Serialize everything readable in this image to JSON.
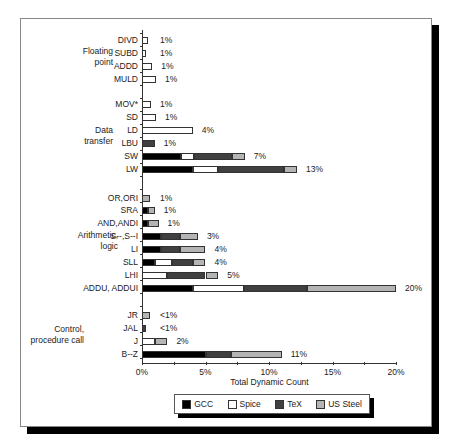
{
  "chart_data": {
    "type": "bar",
    "orientation": "horizontal-stacked",
    "title": "",
    "xlabel": "Total Dynamic Count",
    "ylabel": "",
    "xlim": [
      0,
      20
    ],
    "x_ticks": [
      "0%",
      "5%",
      "10%",
      "15%",
      "20%"
    ],
    "grid": false,
    "legend_position": "bottom",
    "series_names": [
      "GCC",
      "Spice",
      "TeX",
      "US Steel"
    ],
    "series_colors": [
      "#000000",
      "#ffffff",
      "#404040",
      "#b4b4b4"
    ],
    "groups": [
      {
        "name": "Floating point",
        "rows": [
          "DIVD",
          "SUBD",
          "ADDD",
          "MULD"
        ]
      },
      {
        "name": "Data transfer",
        "rows": [
          "MOV*",
          "SD",
          "LD",
          "LBU",
          "SW",
          "LW"
        ]
      },
      {
        "name": "Arithmetic, logic",
        "rows": [
          "OR,ORI",
          "SRA",
          "AND,ANDI",
          "S--,S--I",
          "LI",
          "SLL",
          "LHI",
          "ADDU, ADDUI"
        ]
      },
      {
        "name": "Control, procedure call",
        "rows": [
          "JR",
          "JAL",
          "J",
          "B--Z"
        ]
      }
    ],
    "categories": [
      "DIVD",
      "SUBD",
      "ADDD",
      "MULD",
      "MOV*",
      "SD",
      "LD",
      "LBU",
      "SW",
      "LW",
      "OR,ORI",
      "SRA",
      "AND,ANDI",
      "S--,S--I",
      "LI",
      "SLL",
      "LHI",
      "ADDU, ADDUI",
      "JR",
      "JAL",
      "J",
      "B--Z"
    ],
    "series": [
      {
        "name": "GCC",
        "values": [
          0,
          0,
          0,
          0,
          0,
          0,
          0,
          0,
          3.1,
          4.0,
          0,
          0.5,
          0.5,
          1.5,
          1.5,
          1.0,
          0,
          4.0,
          0,
          0,
          0,
          5.0
        ]
      },
      {
        "name": "Spice",
        "values": [
          0.5,
          0.3,
          0.8,
          1.1,
          0.7,
          1.1,
          4.0,
          0,
          1.0,
          2.0,
          0,
          0,
          0,
          0,
          0,
          1.4,
          2.0,
          4.0,
          0,
          0,
          1.0,
          0
        ]
      },
      {
        "name": "TeX",
        "values": [
          0,
          0,
          0,
          0,
          0,
          0,
          0,
          1.0,
          3.0,
          5.2,
          0,
          0,
          0,
          1.5,
          1.5,
          1.6,
          3.0,
          5.0,
          0,
          0.3,
          0,
          2.0
        ]
      },
      {
        "name": "US Steel",
        "values": [
          0,
          0,
          0,
          0,
          0,
          0,
          0,
          0,
          1.0,
          1.0,
          0.6,
          0.5,
          0.8,
          1.4,
          2.0,
          1.0,
          1.0,
          7.0,
          0.6,
          0,
          1.0,
          4.0
        ]
      }
    ],
    "value_labels": [
      "1%",
      "1%",
      "1%",
      "1%",
      "1%",
      "1%",
      "4%",
      "1%",
      "7%",
      "13%",
      "1%",
      "1%",
      "1%",
      "3%",
      "4%",
      "4%",
      "5%",
      "20%",
      "<1%",
      "<1%",
      "2%",
      "11%"
    ]
  },
  "legend": {
    "items": [
      {
        "label": "GCC",
        "color": "#000000"
      },
      {
        "label": "Spice",
        "color": "#ffffff"
      },
      {
        "label": "TeX",
        "color": "#404040"
      },
      {
        "label": "US Steel",
        "color": "#b4b4b4"
      }
    ]
  },
  "group_labels": [
    {
      "line1": "Floating",
      "line2": "point"
    },
    {
      "line1": "Data",
      "line2": "transfer"
    },
    {
      "line1": "Arithmetic,",
      "line2": "logic"
    },
    {
      "line1": "Control,",
      "line2": "procedure call"
    }
  ]
}
